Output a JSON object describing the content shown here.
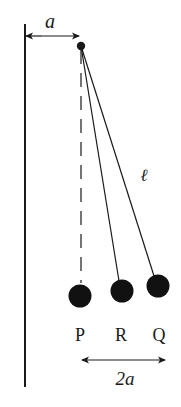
{
  "diagram": {
    "type": "pendulum-configuration",
    "labels": {
      "wall_distance": "a",
      "string_length": "ℓ",
      "ball_p": "P",
      "ball_r": "R",
      "ball_q": "Q",
      "separation": "2a"
    },
    "colors": {
      "ink": "#1a1a1a",
      "background": "#ffffff"
    }
  }
}
